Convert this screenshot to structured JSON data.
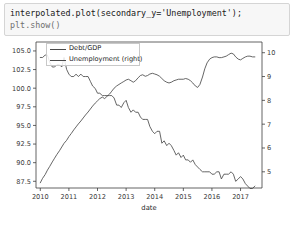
{
  "cell": {
    "code_line_1": "interpolated.plot(secondary_y='Unemployment');",
    "code_line_2": "plt.show()"
  },
  "chart_data": {
    "type": "line",
    "title": "",
    "xlabel": "date",
    "ylabel": "",
    "grid": false,
    "legend_position": "upper left",
    "dual_axis": true,
    "xlim": [
      2009.85,
      2017.75
    ],
    "x_ticks": [
      "2010",
      "2011",
      "2012",
      "2013",
      "2014",
      "2015",
      "2016",
      "2017"
    ],
    "left_axis": {
      "name": "Debt/GDP",
      "ylim": [
        86.6,
        106.2
      ],
      "ticks": [
        "87.5",
        "90.0",
        "92.5",
        "95.0",
        "97.5",
        "100.0",
        "102.5",
        "105.0"
      ],
      "tick_values": [
        87.5,
        90.0,
        92.5,
        95.0,
        97.5,
        100.0,
        102.5,
        105.0
      ]
    },
    "right_axis": {
      "name": "Unemployment (right)",
      "ylim": [
        4.32,
        10.45
      ],
      "ticks": [
        "5",
        "6",
        "7",
        "8",
        "9",
        "10"
      ],
      "tick_values": [
        5,
        6,
        7,
        8,
        9,
        10
      ]
    },
    "series": [
      {
        "name": "Debt/GDP",
        "axis": "left",
        "color": "#4a4a4a",
        "x": [
          2010.0,
          2010.08,
          2010.17,
          2010.25,
          2010.33,
          2010.42,
          2010.5,
          2010.58,
          2010.67,
          2010.75,
          2010.83,
          2010.92,
          2011.0,
          2011.08,
          2011.17,
          2011.25,
          2011.33,
          2011.42,
          2011.5,
          2011.58,
          2011.67,
          2011.75,
          2011.83,
          2011.92,
          2012.0,
          2012.08,
          2012.17,
          2012.25,
          2012.33,
          2012.42,
          2012.5,
          2012.58,
          2012.67,
          2012.75,
          2012.83,
          2012.92,
          2013.0,
          2013.08,
          2013.17,
          2013.25,
          2013.33,
          2013.42,
          2013.5,
          2013.58,
          2013.67,
          2013.75,
          2013.83,
          2013.92,
          2014.0,
          2014.08,
          2014.17,
          2014.25,
          2014.33,
          2014.42,
          2014.5,
          2014.58,
          2014.67,
          2014.75,
          2014.83,
          2014.92,
          2015.0,
          2015.08,
          2015.17,
          2015.25,
          2015.33,
          2015.42,
          2015.5,
          2015.58,
          2015.67,
          2015.75,
          2015.83,
          2015.92,
          2016.0,
          2016.08,
          2016.17,
          2016.25,
          2016.33,
          2016.42,
          2016.5,
          2016.58,
          2016.67,
          2016.75,
          2016.83,
          2016.92,
          2017.0,
          2017.08,
          2017.17,
          2017.25,
          2017.33,
          2017.42,
          2017.5
        ],
        "y": [
          87.3,
          87.9,
          88.4,
          89.0,
          89.5,
          90.1,
          90.6,
          91.1,
          91.6,
          92.1,
          92.6,
          93.0,
          93.5,
          93.9,
          94.4,
          94.8,
          95.2,
          95.6,
          96.0,
          96.4,
          96.8,
          97.2,
          97.6,
          98.0,
          98.3,
          98.6,
          98.8,
          98.6,
          98.9,
          99.2,
          99.6,
          100.0,
          100.3,
          100.5,
          100.7,
          100.9,
          101.1,
          101.2,
          101.0,
          100.8,
          101.0,
          101.4,
          101.7,
          101.8,
          101.6,
          101.7,
          101.9,
          102.0,
          101.9,
          101.8,
          101.6,
          101.3,
          101.0,
          100.8,
          100.7,
          100.8,
          101.0,
          101.1,
          101.2,
          101.2,
          101.2,
          101.3,
          101.2,
          101.0,
          100.7,
          100.3,
          100.1,
          100.5,
          101.5,
          102.6,
          103.4,
          103.9,
          104.1,
          104.2,
          104.2,
          104.1,
          104.1,
          104.2,
          104.3,
          104.5,
          104.7,
          104.6,
          104.2,
          103.9,
          103.8,
          104.0,
          104.2,
          104.3,
          104.3,
          104.2,
          104.2
        ]
      },
      {
        "name": "Unemployment (right)",
        "axis": "right",
        "color": "#4a4a4a",
        "x": [
          2010.0,
          2010.08,
          2010.17,
          2010.25,
          2010.33,
          2010.42,
          2010.5,
          2010.58,
          2010.67,
          2010.75,
          2010.83,
          2010.92,
          2011.0,
          2011.08,
          2011.17,
          2011.25,
          2011.33,
          2011.42,
          2011.5,
          2011.58,
          2011.67,
          2011.75,
          2011.83,
          2011.92,
          2012.0,
          2012.08,
          2012.17,
          2012.25,
          2012.33,
          2012.42,
          2012.5,
          2012.58,
          2012.67,
          2012.75,
          2012.83,
          2012.92,
          2013.0,
          2013.08,
          2013.17,
          2013.25,
          2013.33,
          2013.42,
          2013.5,
          2013.58,
          2013.67,
          2013.75,
          2013.83,
          2013.92,
          2014.0,
          2014.08,
          2014.17,
          2014.25,
          2014.33,
          2014.42,
          2014.5,
          2014.58,
          2014.67,
          2014.75,
          2014.83,
          2014.92,
          2015.0,
          2015.08,
          2015.17,
          2015.25,
          2015.33,
          2015.42,
          2015.5,
          2015.58,
          2015.67,
          2015.75,
          2015.83,
          2015.92,
          2016.0,
          2016.08,
          2016.17,
          2016.25,
          2016.33,
          2016.42,
          2016.5,
          2016.58,
          2016.67,
          2016.75,
          2016.83,
          2016.92,
          2017.0,
          2017.08,
          2017.17,
          2017.25,
          2017.33,
          2017.42,
          2017.5
        ],
        "y": [
          9.8,
          9.8,
          9.9,
          9.9,
          9.6,
          9.4,
          9.4,
          9.5,
          9.5,
          9.4,
          9.8,
          9.3,
          9.1,
          9.0,
          9.0,
          9.1,
          9.0,
          9.1,
          9.0,
          9.0,
          9.0,
          8.8,
          8.6,
          8.5,
          8.3,
          8.3,
          8.2,
          8.2,
          8.2,
          8.2,
          8.2,
          8.1,
          7.8,
          7.8,
          7.7,
          7.9,
          8.0,
          7.7,
          7.5,
          7.6,
          7.5,
          7.5,
          7.3,
          7.2,
          7.2,
          7.2,
          6.9,
          6.7,
          6.6,
          6.7,
          6.7,
          6.2,
          6.3,
          6.1,
          6.2,
          6.1,
          5.9,
          5.7,
          5.8,
          5.6,
          5.7,
          5.5,
          5.5,
          5.4,
          5.5,
          5.3,
          5.2,
          5.1,
          5.0,
          5.0,
          5.0,
          5.0,
          4.9,
          4.9,
          5.0,
          5.0,
          4.7,
          4.9,
          4.9,
          4.9,
          5.0,
          4.9,
          4.6,
          4.7,
          4.8,
          4.7,
          4.5,
          4.4,
          4.3,
          4.3,
          4.4
        ]
      }
    ]
  }
}
